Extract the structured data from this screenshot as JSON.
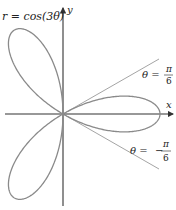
{
  "figure": {
    "equation_label": "r = cos(3θ)",
    "x_axis_label": "x",
    "y_axis_label": "y",
    "line_upper": {
      "lhs": "θ =",
      "numerator": "π",
      "denominator": "6",
      "sign": ""
    },
    "line_lower": {
      "lhs": "θ =",
      "numerator": "π",
      "denominator": "6",
      "sign": "−"
    },
    "curve_color": "#8a8a8a",
    "axis_color": "#333333",
    "ray_color": "#9a9a9a"
  },
  "chart_data": {
    "type": "line",
    "title": "r = cos(3θ)",
    "polar_function": "r = cos(3θ)",
    "theta_range": [
      0,
      3.14159
    ],
    "petals": 3,
    "petal_directions_deg": [
      0,
      120,
      240
    ],
    "rays": [
      {
        "label": "θ = π/6",
        "angle_deg": 30
      },
      {
        "label": "θ = −π/6",
        "angle_deg": -30
      }
    ],
    "xlabel": "x",
    "ylabel": "y",
    "grid": false
  }
}
